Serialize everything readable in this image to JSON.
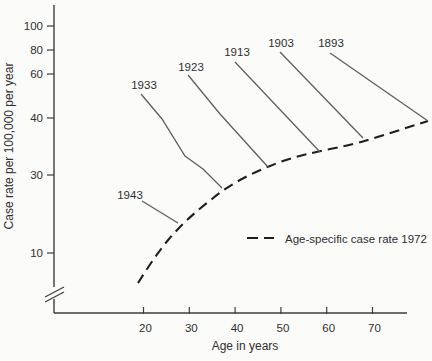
{
  "figure": {
    "colors": {
      "background": "#fbfbfa",
      "axis": "#3d3d3d",
      "solid_line": "#5f5f5f",
      "dashed_line": "#1e1e1e",
      "text": "#2f2f2f"
    }
  },
  "chart_data": {
    "type": "line",
    "title": "",
    "xlabel": "Age in years",
    "ylabel": "Case rate per 100,000 per year",
    "x_axis": {
      "ticks": [
        20,
        30,
        40,
        50,
        60,
        70
      ],
      "range": [
        8,
        78
      ]
    },
    "y_axis": {
      "ticks": [
        100,
        80,
        60,
        40,
        30,
        10
      ],
      "scale": "logarithmic with axis break below 10",
      "range": [
        5,
        110
      ]
    },
    "legend": {
      "position": "inside-lower-right",
      "entries": [
        {
          "label": "Age-specific case rate 1972",
          "style": "dashed"
        }
      ]
    },
    "series": [
      {
        "name": "1943",
        "style": "solid",
        "points_age_rate": [
          [
            20,
            21
          ],
          [
            27.5,
            15
          ]
        ]
      },
      {
        "name": "1933",
        "style": "solid",
        "points_age_rate": [
          [
            20,
            50
          ],
          [
            24,
            40
          ],
          [
            29,
            33
          ],
          [
            33,
            31
          ],
          [
            37,
            25
          ]
        ]
      },
      {
        "name": "1923",
        "style": "solid",
        "points_age_rate": [
          [
            29.5,
            60
          ],
          [
            36.5,
            42
          ],
          [
            47,
            31
          ]
        ]
      },
      {
        "name": "1913",
        "style": "solid",
        "points_age_rate": [
          [
            40,
            69
          ],
          [
            58.5,
            34
          ]
        ]
      },
      {
        "name": "1903",
        "style": "solid",
        "points_age_rate": [
          [
            50,
            79
          ],
          [
            68,
            36
          ]
        ]
      },
      {
        "name": "1893",
        "style": "solid",
        "points_age_rate": [
          [
            61,
            78
          ],
          [
            82,
            39
          ]
        ]
      },
      {
        "name": "Age-specific case rate 1972",
        "style": "dashed",
        "points_age_rate": [
          [
            19,
            6.5
          ],
          [
            22,
            8.5
          ],
          [
            26,
            12.5
          ],
          [
            30,
            17
          ],
          [
            35,
            21
          ],
          [
            40,
            26
          ],
          [
            45,
            30
          ],
          [
            47,
            31
          ],
          [
            53,
            33
          ],
          [
            58.5,
            34
          ],
          [
            63,
            35
          ],
          [
            68,
            36
          ],
          [
            75,
            37.5
          ],
          [
            82,
            39
          ]
        ]
      }
    ]
  },
  "geometry": {
    "canvas": {
      "width": 432,
      "height": 361
    },
    "y_axis": {
      "x": 54,
      "y1": 5,
      "y2": 313
    },
    "x_axis": {
      "y": 313,
      "x1": 54,
      "x2": 407
    },
    "tick_len": 7,
    "y_ticks": [
      {
        "label": "100",
        "y": 26
      },
      {
        "label": "80",
        "y": 50
      },
      {
        "label": "60",
        "y": 74
      },
      {
        "label": "40",
        "y": 118
      },
      {
        "label": "30",
        "y": 175
      },
      {
        "label": "10",
        "y": 253
      }
    ],
    "x_ticks": [
      {
        "label": "20",
        "x": 143.5
      },
      {
        "label": "30",
        "x": 189.3
      },
      {
        "label": "40",
        "x": 235.1
      },
      {
        "label": "50",
        "x": 280.9
      },
      {
        "label": "60",
        "x": 326.7
      },
      {
        "label": "70",
        "x": 372.5
      }
    ],
    "axis_break": {
      "mask": {
        "x": 46,
        "y": 287,
        "w": 16,
        "h": 12
      },
      "lines": [
        [
          45,
          297,
          64,
          287
        ],
        [
          45,
          302,
          64,
          292
        ]
      ]
    },
    "cohorts": [
      {
        "label": "1943",
        "label_x": 130,
        "label_y": 199,
        "points": "142,201 178,223"
      },
      {
        "label": "1933",
        "label_x": 144,
        "label_y": 89,
        "points": "141,94 162,119 185,156 203,169 222,188"
      },
      {
        "label": "1923",
        "label_x": 191,
        "label_y": 71,
        "points": "188,75 220,114 268,167"
      },
      {
        "label": "1913",
        "label_x": 237,
        "label_y": 56,
        "points": "235,62 320,152"
      },
      {
        "label": "1903",
        "label_x": 281,
        "label_y": 47,
        "points": "280,52 363,138"
      },
      {
        "label": "1893",
        "label_x": 331,
        "label_y": 47,
        "points": "330,53 428,121"
      }
    ],
    "dashed_curve": {
      "d": "M138,283 C147,269 157,253 169,239 C181,225 196,211 212,199 C230,184 250,174 270,166 C291,157 315,152 340,147 C365,142 396,131 428,121"
    }
  }
}
